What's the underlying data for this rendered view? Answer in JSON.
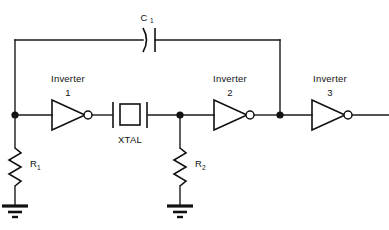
{
  "diagram": {
    "background_color": "#ffffff",
    "line_color": "#111111",
    "labels": {
      "capacitor": "C",
      "capacitor_sub": "1",
      "inverter1": "Inverter",
      "inverter1_num": "1",
      "inverter2": "Inverter",
      "inverter2_num": "2",
      "inverter3": "Inverter",
      "inverter3_num": "3",
      "crystal": "XTAL",
      "resistor1": "R",
      "resistor1_sub": "1",
      "resistor2": "R",
      "resistor2_sub": "2"
    },
    "components": [
      {
        "name": "capacitor-c1",
        "type": "capacitor",
        "label": "C1"
      },
      {
        "name": "inverter-1",
        "type": "inverter",
        "label": "Inverter 1"
      },
      {
        "name": "inverter-2",
        "type": "inverter",
        "label": "Inverter 2"
      },
      {
        "name": "inverter-3",
        "type": "inverter",
        "label": "Inverter 3"
      },
      {
        "name": "crystal-xtal",
        "type": "crystal",
        "label": "XTAL"
      },
      {
        "name": "resistor-r1",
        "type": "resistor",
        "label": "R1"
      },
      {
        "name": "resistor-r2",
        "type": "resistor",
        "label": "R2"
      },
      {
        "name": "ground-1",
        "type": "ground",
        "label": ""
      },
      {
        "name": "ground-2",
        "type": "ground",
        "label": ""
      }
    ],
    "nodes": [
      {
        "name": "junction-input-node",
        "x": 15,
        "y": 115
      },
      {
        "name": "junction-mid-node",
        "x": 180,
        "y": 115
      },
      {
        "name": "junction-feedback-node",
        "x": 280,
        "y": 115
      }
    ]
  }
}
